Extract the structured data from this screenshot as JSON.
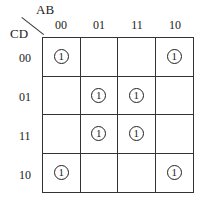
{
  "kmap": {
    "row_var": "CD",
    "col_var": "AB",
    "col_labels": [
      "00",
      "01",
      "11",
      "10"
    ],
    "row_labels": [
      "00",
      "01",
      "11",
      "10"
    ],
    "cells": [
      [
        "1",
        "",
        "",
        "1"
      ],
      [
        "",
        "1",
        "1",
        ""
      ],
      [
        "",
        "1",
        "1",
        ""
      ],
      [
        "1",
        "",
        "",
        "1"
      ]
    ]
  }
}
